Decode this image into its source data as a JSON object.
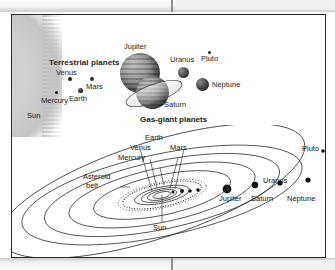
{
  "figure": {
    "title_visible": false,
    "panels": [
      {
        "name": "relative-sizes-panel",
        "groups": [
          {
            "label": "Terrestrial planets"
          },
          {
            "label": "Gas-giant planets"
          }
        ],
        "bodies": [
          {
            "label": "Sun",
            "kind": "star"
          },
          {
            "label": "Mercury",
            "kind": "terrestrial"
          },
          {
            "label": "Venus",
            "kind": "terrestrial"
          },
          {
            "label": "Earth",
            "kind": "terrestrial"
          },
          {
            "label": "Mars",
            "kind": "terrestrial"
          },
          {
            "label": "Jupiter",
            "kind": "gas-giant"
          },
          {
            "label": "Saturn",
            "kind": "gas-giant"
          },
          {
            "label": "Uranus",
            "kind": "gas-giant"
          },
          {
            "label": "Neptune",
            "kind": "gas-giant"
          },
          {
            "label": "Pluto",
            "kind": "dwarf"
          }
        ]
      },
      {
        "name": "orbits-panel",
        "center_label": "Sun",
        "features": [
          {
            "label": "Asteroid belt",
            "line1": "Asteroid",
            "line2": "belt"
          }
        ],
        "orbit_labels": [
          {
            "label": "Mercury"
          },
          {
            "label": "Venus"
          },
          {
            "label": "Earth"
          },
          {
            "label": "Mars"
          },
          {
            "label": "Jupiter"
          },
          {
            "label": "Saturn"
          },
          {
            "label": "Uranus"
          },
          {
            "label": "Neptune"
          },
          {
            "label": "Pluto"
          }
        ]
      }
    ]
  },
  "colors": {
    "frame": "#2b2b2b",
    "ink": "#141414",
    "page": "#ffffff",
    "margin_band": "#e9e9e9"
  }
}
